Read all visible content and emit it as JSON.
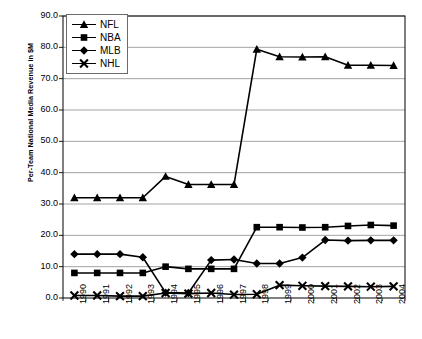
{
  "chart_data": {
    "type": "line",
    "title": "",
    "xlabel": "",
    "ylabel": "Per-Team National Media Revenue in $M",
    "x": [
      1990,
      1991,
      1992,
      1993,
      1994,
      1995,
      1996,
      1997,
      1998,
      1999,
      2000,
      2001,
      2002,
      2003,
      2004
    ],
    "xtick_labels": [
      "1990",
      "1991",
      "1992",
      "1993",
      "1994",
      "1995",
      "1996",
      "1997",
      "1998",
      "1999",
      "2000",
      "2001",
      "2002",
      "2003",
      "2004"
    ],
    "ytick_labels": [
      "0.0",
      "10.0",
      "20.0",
      "30.0",
      "40.0",
      "50.0",
      "60.0",
      "70.0",
      "80.0",
      "90.0"
    ],
    "ylim": [
      0.0,
      90.0
    ],
    "ytick_step": 10.0,
    "grid": true,
    "grid_axis": "y",
    "legend_position": "top-left-inside",
    "series": [
      {
        "name": "NFL",
        "marker": "triangle",
        "color": "#000000",
        "values": [
          32.0,
          32.0,
          32.0,
          32.0,
          38.8,
          36.2,
          36.2,
          36.2,
          79.4,
          77.0,
          76.9,
          77.0,
          74.3,
          74.3,
          74.2
        ]
      },
      {
        "name": "NBA",
        "marker": "square",
        "color": "#000000",
        "values": [
          8.0,
          8.0,
          8.0,
          8.0,
          10.0,
          9.3,
          9.3,
          9.3,
          22.6,
          22.6,
          22.5,
          22.6,
          23.0,
          23.3,
          23.1
        ]
      },
      {
        "name": "MLB",
        "marker": "diamond",
        "color": "#000000",
        "values": [
          14.0,
          14.0,
          14.0,
          13.0,
          1.7,
          1.6,
          12.1,
          12.3,
          11.0,
          11.0,
          12.9,
          18.5,
          18.3,
          18.4,
          18.4
        ]
      },
      {
        "name": "NHL",
        "marker": "cross",
        "color": "#000000",
        "values": [
          0.8,
          0.8,
          0.6,
          0.6,
          1.6,
          1.4,
          1.6,
          1.1,
          1.2,
          4.1,
          3.9,
          3.8,
          3.7,
          3.6,
          3.7
        ]
      }
    ]
  },
  "axes": {
    "plot_left": 63,
    "plot_right": 405,
    "plot_top": 16,
    "plot_bottom": 298,
    "axis_color": "#000000",
    "gridline_color": "#8c8c8c"
  }
}
